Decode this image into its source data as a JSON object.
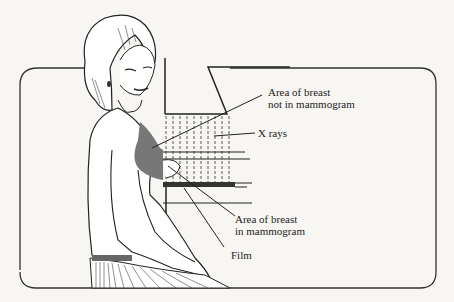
{
  "figure": {
    "labels": {
      "not_in_mammogram": [
        "Area of breast",
        "not in mammogram"
      ],
      "xrays": "X rays",
      "in_mammogram": [
        "Area of breast",
        "in mammogram"
      ],
      "film": "Film"
    }
  }
}
